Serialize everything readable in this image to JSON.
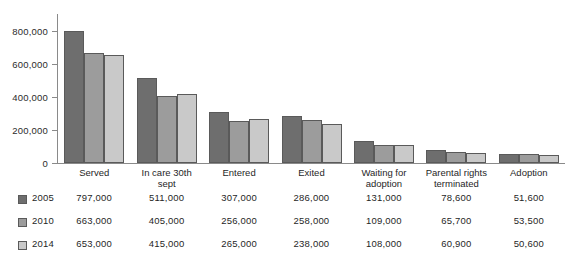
{
  "chart_data": {
    "type": "bar",
    "title": "",
    "subtitle": "",
    "xlabel": "",
    "ylabel": "",
    "ylim": [
      0,
      900000
    ],
    "grid": false,
    "legend_position": "bottom-left",
    "categories": [
      "Served",
      "In care 30th\nsept",
      "Entered",
      "Exited",
      "Waiting for\nadoption",
      "Parental rights\nterminated",
      "Adoption"
    ],
    "ytick_labels": [
      "0",
      "200,000",
      "400,000",
      "600,000",
      "800,000"
    ],
    "ytick_values": [
      0,
      200000,
      400000,
      600000,
      800000
    ],
    "series": [
      {
        "name": "2005",
        "color": "#6e6e6e",
        "values": [
          797000,
          511000,
          307000,
          286000,
          131000,
          78600,
          51600
        ],
        "labels": [
          "797,000",
          "511,000",
          "307,000",
          "286,000",
          "131,000",
          "78,600",
          "51,600"
        ]
      },
      {
        "name": "2010",
        "color": "#9c9c9c",
        "values": [
          663000,
          405000,
          256000,
          258000,
          109000,
          65700,
          53500
        ],
        "labels": [
          "663,000",
          "405,000",
          "256,000",
          "258,000",
          "109,000",
          "65,700",
          "53,500"
        ]
      },
      {
        "name": "2014",
        "color": "#c9c9c9",
        "values": [
          653000,
          415000,
          265000,
          238000,
          108000,
          60900,
          50600
        ],
        "labels": [
          "653,000",
          "415,000",
          "265,000",
          "238,000",
          "108,000",
          "60,900",
          "50,600"
        ]
      }
    ]
  },
  "legend": {
    "rows": [
      {
        "year": "2005",
        "color": "#6e6e6e"
      },
      {
        "year": "2010",
        "color": "#9c9c9c"
      },
      {
        "year": "2014",
        "color": "#c9c9c9"
      }
    ]
  },
  "bottom_caption": {
    "text": ""
  }
}
